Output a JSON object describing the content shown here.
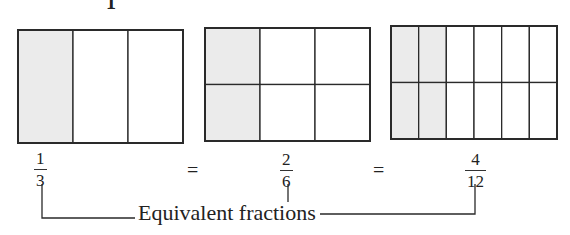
{
  "heading_fragment": "1",
  "figures": [
    {
      "id": "one-third",
      "columns": 3,
      "rows": 1,
      "shaded_columns": 1,
      "fraction": {
        "numerator": "1",
        "denominator": "3"
      }
    },
    {
      "id": "two-sixths",
      "columns": 3,
      "rows": 2,
      "shaded_columns": 1,
      "fraction": {
        "numerator": "2",
        "denominator": "6"
      }
    },
    {
      "id": "four-twelfths",
      "columns": 6,
      "rows": 2,
      "shaded_columns": 2,
      "fraction": {
        "numerator": "4",
        "denominator": "12"
      }
    }
  ],
  "equals_sign": "=",
  "bracket_label": "Equivalent fractions",
  "colors": {
    "shade": "#ebebeb",
    "line": "#2a2a2a"
  }
}
